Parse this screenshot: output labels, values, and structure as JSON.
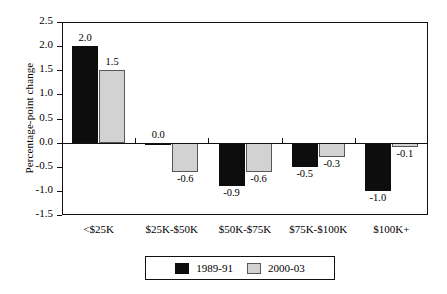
{
  "chart_data": {
    "type": "bar",
    "title": "",
    "subtitle": "",
    "xlabel": "",
    "ylabel": "Percentage-point change",
    "categories": [
      "<$25K",
      "$25K-$50K",
      "$50K-$75K",
      "$75K-$100K",
      "$100K+"
    ],
    "series": [
      {
        "name": "1989-91",
        "color": "#0d0d0d",
        "values": [
          2.0,
          0.0,
          -0.9,
          -0.5,
          -1.0
        ],
        "labels": [
          "2.0",
          "0.0",
          "-0.9",
          "-0.5",
          "-1.0"
        ]
      },
      {
        "name": "2000-03",
        "color": "#d2d2d2",
        "values": [
          1.5,
          -0.6,
          -0.6,
          -0.3,
          -0.1
        ],
        "labels": [
          "1.5",
          "-0.6",
          "-0.6",
          "-0.3",
          "-0.1"
        ]
      }
    ],
    "ylim": [
      -1.5,
      2.5
    ],
    "ytick_step": 0.5,
    "yticks": [
      2.5,
      2.0,
      1.5,
      1.0,
      0.5,
      0.0,
      -0.5,
      -1.0,
      -1.5
    ],
    "ytick_labels": [
      "2.5",
      "2.0",
      "1.5",
      "1.0",
      "0.5",
      "0.0",
      "-0.5",
      "-1.0",
      "-1.5"
    ],
    "grid": false,
    "legend_position": "bottom",
    "zero_line": true,
    "frame": true
  },
  "legend": {
    "entries": [
      {
        "label": "1989-91",
        "swatch": "black-swatch"
      },
      {
        "label": "2000-03",
        "swatch": "gray-swatch"
      }
    ]
  }
}
